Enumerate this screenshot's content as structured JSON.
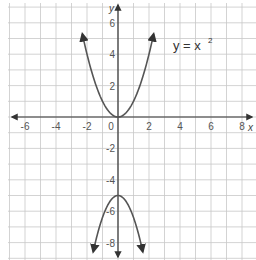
{
  "chart_data": {
    "type": "line",
    "title": "",
    "xlabel": "x",
    "ylabel": "y",
    "xlim": [
      -7,
      8.6
    ],
    "ylim": [
      -8.8,
      7.3
    ],
    "grid": true,
    "x_ticks": [
      -6,
      -4,
      -2,
      0,
      2,
      4,
      6,
      8
    ],
    "y_ticks": [
      -8,
      -6,
      -4,
      -2,
      2,
      4,
      6
    ],
    "x_tick_labels": [
      "-6",
      "-4",
      "-2",
      "0",
      "2",
      "4",
      "6",
      "8"
    ],
    "y_tick_labels": [
      "-8",
      "-6",
      "-4",
      "-2",
      "2",
      "4",
      "6"
    ],
    "annotations": [
      {
        "text": "y =  x",
        "superscript": "2",
        "x": 2.6,
        "y": 4.6
      }
    ],
    "series": [
      {
        "name": "y = x^2",
        "equation": "y = x^2",
        "x": [
          -2.3,
          -2,
          -1.5,
          -1,
          -0.5,
          0,
          0.5,
          1,
          1.5,
          2,
          2.3
        ],
        "values": [
          5.29,
          4,
          2.25,
          1,
          0.25,
          0,
          0.25,
          1,
          2.25,
          4,
          5.29
        ],
        "arrows": true
      },
      {
        "name": "downward parabola",
        "equation": "y = -x^2*1.4 - 5",
        "x": [
          -1.6,
          -1.2,
          -0.8,
          -0.4,
          0,
          0.4,
          0.8,
          1.2,
          1.6
        ],
        "values": [
          -8.58,
          -7.02,
          -5.9,
          -5.22,
          -5,
          -5.22,
          -5.9,
          -7.02,
          -8.58
        ],
        "arrows": true
      }
    ]
  },
  "labels": {
    "x_axis": "x",
    "y_axis": "y",
    "equation_main": "y =  x",
    "equation_sup": "2",
    "origin": "0"
  },
  "colors": {
    "grid": "#c8c8c8",
    "axis": "#333333",
    "curve": "#555555"
  }
}
